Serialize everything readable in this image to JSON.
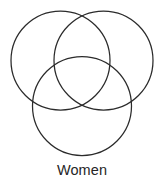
{
  "figure": {
    "type": "venn-diagram",
    "caption": "Women",
    "background_color": "#ffffff",
    "stroke_color": "#2b2b2b",
    "stroke_width": 1.25,
    "circles": [
      {
        "name": "top-left-circle",
        "cx": 60.5,
        "cy": 60.5,
        "r": 49.5
      },
      {
        "name": "top-right-circle",
        "cx": 103.5,
        "cy": 60.5,
        "r": 49.5
      },
      {
        "name": "bottom-circle",
        "cx": 82.0,
        "cy": 106.0,
        "r": 49.5
      }
    ]
  }
}
